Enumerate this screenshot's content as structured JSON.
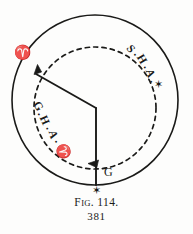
{
  "figure": {
    "title": "Fig. 114.",
    "caption_prefix": "F",
    "caption_smallcaps": "IG",
    "caption_suffix": ". 114.",
    "page_number": "381",
    "background_color": "#fdfdfc",
    "ink_color": "#1a1a18"
  },
  "labels": {
    "aries_top_left": "♈",
    "sha_arc": "S.H.A.",
    "sha_star": "✶",
    "gha_arc": "G.H.A.",
    "gha_aries": "♈",
    "greenwich_point": "G",
    "bottom_star": "✶"
  },
  "arc_letters": {
    "sha": [
      "S",
      ".",
      "H",
      ".",
      "A",
      "."
    ],
    "gha": [
      "G",
      ".",
      "H",
      ".",
      "A",
      "."
    ]
  },
  "geometry": {
    "outer_circle": {
      "cx": 95,
      "cy": 100,
      "rx": 83,
      "ry": 85
    },
    "inner_dashed_circle": {
      "cx": 95,
      "cy": 108,
      "r": 61
    },
    "vertex": {
      "x": 96,
      "y": 108
    },
    "aries_ray_end": {
      "x": 36,
      "y": 74
    },
    "greenwich_ray_end": {
      "x": 96,
      "y": 185
    }
  },
  "annotations": {
    "sha_arrow_direction": "counterclockwise-to-star",
    "gha_arrow_direction": "westward-from-greenwich",
    "dashed_stroke": "4,4"
  }
}
